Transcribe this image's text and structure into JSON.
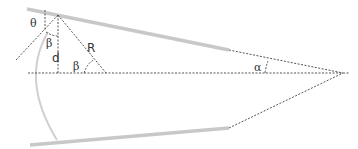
{
  "diagram": {
    "labels": {
      "theta": "θ",
      "beta_top": "β",
      "d": "d",
      "R": "R",
      "beta_bottom": "β",
      "alpha": "α"
    },
    "colors": {
      "surface": "#c8c8c8",
      "dashed": "#555555",
      "text": "#333333"
    }
  }
}
